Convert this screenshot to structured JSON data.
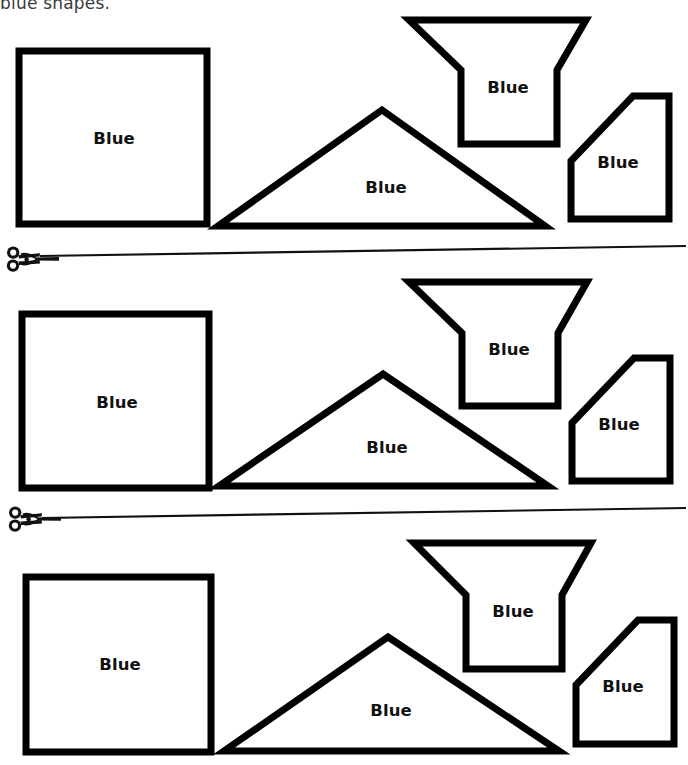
{
  "document": {
    "heading": "blue shapes.",
    "label_text": "Blue",
    "ink_color": "#000000",
    "heading_color": "#3b3b3d",
    "background_color": "#ffffff",
    "stroke_width": 7
  },
  "rows": [
    {
      "id": "row-1",
      "shapes": [
        {
          "name": "square",
          "label": "Blue",
          "points": "19,51 207,51 207,224 19,224",
          "label_x": 114,
          "label_y": 139
        },
        {
          "name": "triangle",
          "label": "Blue",
          "points": "382,110 545,226 218,226",
          "label_x": 386,
          "label_y": 188
        },
        {
          "name": "funnel-hexagon",
          "label": "Blue",
          "points": "409,20 586,20 557,70 557,144 461,144 461,70",
          "label_x": 508,
          "label_y": 88
        },
        {
          "name": "pentagon",
          "label": "Blue",
          "points": "571,161 633,96 669,96 669,219 571,219",
          "label_x": 618,
          "label_y": 163
        }
      ]
    },
    {
      "id": "row-2",
      "shapes": [
        {
          "name": "square",
          "label": "Blue",
          "points": "22,314 209,314 209,488 22,488",
          "label_x": 117,
          "label_y": 403
        },
        {
          "name": "triangle",
          "label": "Blue",
          "points": "383,374 548,486 219,486",
          "label_x": 387,
          "label_y": 448
        },
        {
          "name": "funnel-hexagon",
          "label": "Blue",
          "points": "409,282 587,282 558,333 558,406 462,406 462,333",
          "label_x": 509,
          "label_y": 350
        },
        {
          "name": "pentagon",
          "label": "Blue",
          "points": "572,423 634,358 670,358 670,481 572,481",
          "label_x": 619,
          "label_y": 425
        }
      ]
    },
    {
      "id": "row-3",
      "shapes": [
        {
          "name": "square",
          "label": "Blue",
          "points": "26,577 211,577 211,752 26,752",
          "label_x": 120,
          "label_y": 665
        },
        {
          "name": "triangle",
          "label": "Blue",
          "points": "388,637 559,751 224,751",
          "label_x": 391,
          "label_y": 711
        },
        {
          "name": "funnel-hexagon",
          "label": "Blue",
          "points": "414,543 591,543 562,595 562,669 466,669 466,595",
          "label_x": 513,
          "label_y": 612
        },
        {
          "name": "pentagon",
          "label": "Blue",
          "points": "576,685 638,620 674,620 674,744 576,744",
          "label_x": 623,
          "label_y": 687
        }
      ]
    }
  ],
  "cut_lines": [
    {
      "id": "cut-line-1",
      "icon": "scissors-icon",
      "icon_x": 4,
      "icon_y": 243,
      "line": {
        "x1": 40,
        "y1": 256,
        "x2": 686,
        "y2": 246
      }
    },
    {
      "id": "cut-line-2",
      "icon": "scissors-icon",
      "icon_x": 6,
      "icon_y": 503,
      "line": {
        "x1": 42,
        "y1": 518,
        "x2": 686,
        "y2": 508
      }
    }
  ]
}
